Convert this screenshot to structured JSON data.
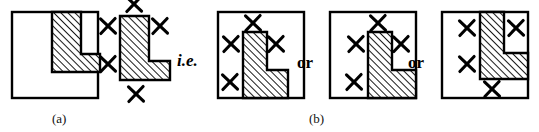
{
  "figure": {
    "type": "geometric-diagram",
    "background_color": "#ffffff",
    "stroke_color": "#000000",
    "hatch_color": "#1a1a1a",
    "hatch_angle_degrees": 45,
    "captions": [
      {
        "id": "caption-a",
        "label": "(a)",
        "x": 52,
        "y": 112
      },
      {
        "id": "caption-b",
        "label": "(b)",
        "x": 309,
        "y": 112
      }
    ],
    "connectors": [
      {
        "id": "connector-ie",
        "label": "i.e.",
        "x": 177,
        "y": 52,
        "style": "italic"
      },
      {
        "id": "connector-or-1",
        "label": "or",
        "x": 297,
        "y": 54,
        "style": "roman"
      },
      {
        "id": "connector-or-2",
        "label": "or",
        "x": 408,
        "y": 54,
        "style": "roman"
      }
    ],
    "panels": [
      {
        "id": "panel-a",
        "name": "square-with-inset-L",
        "x": 12,
        "y": 12,
        "width": 86,
        "height": 86,
        "has_square": true,
        "shape_points": "28,0 57,0 57,42 76,42 76,60 28,60",
        "shape_offset_x": 12,
        "shape_offset_y": 0,
        "x_marks": []
      },
      {
        "id": "panel-L-standalone",
        "name": "standalone-L-with-x-marks",
        "x": 120,
        "y": 16,
        "has_square": false,
        "shape_points": "0,0 29,0 29,45 50,45 50,64 0,64",
        "x_marks": [
          {
            "cx": 14,
            "cy": -12,
            "label": "x-mark-top"
          },
          {
            "cx": -12,
            "cy": 10,
            "label": "x-mark-upper-left"
          },
          {
            "cx": 40,
            "cy": 10,
            "label": "x-mark-right"
          },
          {
            "cx": -12,
            "cy": 48,
            "label": "x-mark-lower-left"
          },
          {
            "cx": 16,
            "cy": 78,
            "label": "x-mark-bottom"
          }
        ]
      },
      {
        "id": "panel-b1",
        "name": "square-with-L-bottom-left",
        "x": 218,
        "y": 12,
        "width": 86,
        "height": 86,
        "has_square": true,
        "shape_points": "25,20 49,20 49,58 70,58 70,86 25,86",
        "x_marks": [
          {
            "cx": 35,
            "cy": 11,
            "label": "x-mark-top"
          },
          {
            "cx": 13,
            "cy": 32,
            "label": "x-mark-upper-left"
          },
          {
            "cx": 58,
            "cy": 32,
            "label": "x-mark-right"
          },
          {
            "cx": 12,
            "cy": 70,
            "label": "x-mark-lower-left"
          }
        ]
      },
      {
        "id": "panel-b2",
        "name": "square-with-L-bottom-right",
        "x": 330,
        "y": 12,
        "width": 86,
        "height": 86,
        "has_square": true,
        "shape_points": "38,20 62,20 62,58 86,58 86,86 38,86",
        "x_marks": [
          {
            "cx": 48,
            "cy": 11,
            "label": "x-mark-top"
          },
          {
            "cx": 26,
            "cy": 32,
            "label": "x-mark-upper-left"
          },
          {
            "cx": 71,
            "cy": 32,
            "label": "x-mark-right"
          },
          {
            "cx": 24,
            "cy": 70,
            "label": "x-mark-lower-left"
          }
        ]
      },
      {
        "id": "panel-b3",
        "name": "square-with-L-top-right",
        "x": 442,
        "y": 12,
        "width": 86,
        "height": 86,
        "has_square": true,
        "shape_points": "38,0 62,0 62,41 86,41 86,67 38,67",
        "x_marks": [
          {
            "cx": 25,
            "cy": 16,
            "label": "x-mark-upper-left"
          },
          {
            "cx": 74,
            "cy": 16,
            "label": "x-mark-upper-right"
          },
          {
            "cx": 25,
            "cy": 52,
            "label": "x-mark-lower-left"
          },
          {
            "cx": 50,
            "cy": 77,
            "label": "x-mark-bottom"
          }
        ]
      }
    ]
  }
}
